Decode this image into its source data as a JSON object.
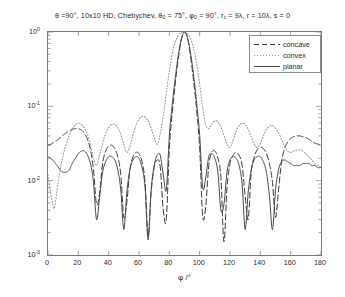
{
  "chart_data": {
    "type": "line",
    "title_parts": {
      "theta": "θ =90°,",
      "array": "10x10 HD,",
      "taper": "Chebychev,",
      "theta0": "θ",
      "theta0_sub": "0",
      "theta0_val": "= 75°,",
      "phi0": "φ",
      "phi0_sub": "0",
      "phi0_val": "= 90°,",
      "rc": "r",
      "rc_sub": "c",
      "rc_val": "= 9λ,",
      "r_val": "r = 10λ,",
      "s_val": "s = 0"
    },
    "xlabel": "φ /°",
    "ylabel": "EΦ(φ)",
    "ylabel_parts": {
      "main": "E",
      "sub": "Φ",
      "arg": "(φ)"
    },
    "xlim": [
      0,
      180
    ],
    "ylim": [
      0.001,
      1
    ],
    "yscale": "log",
    "xticks": [
      0,
      20,
      40,
      60,
      80,
      100,
      120,
      140,
      160,
      180
    ],
    "xtick_labels": [
      "0",
      "20",
      "40",
      "60",
      "80",
      "100",
      "120",
      "140",
      "160",
      "180"
    ],
    "yticks": [
      1,
      0.1,
      0.01,
      0.001
    ],
    "ytick_labels": [
      "10⁰",
      "10⁻¹",
      "10⁻²",
      "10⁻³"
    ],
    "ytick_label_parts": [
      {
        "base": "10",
        "exp": "0"
      },
      {
        "base": "10",
        "exp": "-1"
      },
      {
        "base": "10",
        "exp": "-2"
      },
      {
        "base": "10",
        "exp": "-3"
      }
    ],
    "grid": false,
    "legend_position": "upper right",
    "legend_entries": [
      {
        "label": "concave",
        "style": "dashed",
        "color": "#3a3a3a"
      },
      {
        "label": "convex",
        "style": "dotted",
        "color": "#9a9a9a"
      },
      {
        "label": "planar",
        "style": "solid",
        "color": "#4a4a4a"
      }
    ],
    "main_beam_peak_phi": 90,
    "main_beam_peak_value": 1.0,
    "series": [
      {
        "name": "concave",
        "style": "dashed",
        "color": "#3a3a3a",
        "x": [
          0,
          2,
          4,
          6,
          8,
          10,
          12,
          14,
          16,
          18,
          20,
          22,
          24,
          26,
          28,
          30,
          32,
          34,
          36,
          38,
          40,
          42,
          44,
          46,
          48,
          50,
          52,
          54,
          56,
          58,
          60,
          62,
          64,
          66,
          68,
          70,
          72,
          74,
          76,
          78,
          80,
          82,
          84,
          86,
          88,
          90,
          92,
          94,
          96,
          98,
          100,
          102,
          104,
          106,
          108,
          110,
          112,
          114,
          116,
          118,
          120,
          122,
          124,
          126,
          128,
          130,
          132,
          134,
          136,
          138,
          140,
          142,
          144,
          146,
          148,
          150,
          152,
          154,
          156,
          158,
          160,
          162,
          164,
          166,
          168,
          170,
          172,
          174,
          176,
          178,
          180
        ],
        "y": [
          0.03,
          0.031,
          0.033,
          0.035,
          0.038,
          0.041,
          0.044,
          0.047,
          0.049,
          0.05,
          0.05,
          0.048,
          0.043,
          0.036,
          0.026,
          0.014,
          0.0048,
          0.0068,
          0.017,
          0.025,
          0.029,
          0.03,
          0.027,
          0.021,
          0.012,
          0.0032,
          0.0052,
          0.014,
          0.021,
          0.024,
          0.023,
          0.018,
          0.0095,
          0.0018,
          0.007,
          0.015,
          0.019,
          0.0155,
          0.004,
          0.003,
          0.027,
          0.085,
          0.21,
          0.45,
          0.8,
          1.0,
          0.82,
          0.47,
          0.22,
          0.09,
          0.028,
          0.0033,
          0.0045,
          0.016,
          0.024,
          0.025,
          0.02,
          0.011,
          0.0015,
          0.008,
          0.017,
          0.022,
          0.024,
          0.022,
          0.016,
          0.0062,
          0.003,
          0.013,
          0.021,
          0.026,
          0.028,
          0.027,
          0.023,
          0.017,
          0.0095,
          0.0032,
          0.0075,
          0.018,
          0.027,
          0.033,
          0.037,
          0.039,
          0.04,
          0.04,
          0.039,
          0.038,
          0.036,
          0.034,
          0.032,
          0.031,
          0.03
        ]
      },
      {
        "name": "convex",
        "style": "dotted",
        "color": "#9a9a9a",
        "x": [
          0,
          2,
          4,
          6,
          8,
          10,
          12,
          14,
          16,
          18,
          20,
          22,
          24,
          26,
          28,
          30,
          32,
          34,
          36,
          38,
          40,
          42,
          44,
          46,
          48,
          50,
          52,
          54,
          56,
          58,
          60,
          62,
          64,
          66,
          68,
          70,
          72,
          74,
          76,
          78,
          80,
          82,
          84,
          86,
          88,
          90,
          92,
          94,
          96,
          98,
          100,
          102,
          104,
          106,
          108,
          110,
          112,
          114,
          116,
          118,
          120,
          122,
          124,
          126,
          128,
          130,
          132,
          134,
          136,
          138,
          140,
          142,
          144,
          146,
          148,
          150,
          152,
          154,
          156,
          158,
          160,
          162,
          164,
          166,
          168,
          170,
          172,
          174,
          176,
          178,
          180
        ],
        "y": [
          0.012,
          0.0065,
          0.0042,
          0.0075,
          0.014,
          0.022,
          0.031,
          0.041,
          0.05,
          0.056,
          0.059,
          0.057,
          0.051,
          0.042,
          0.03,
          0.02,
          0.016,
          0.022,
          0.032,
          0.043,
          0.052,
          0.057,
          0.057,
          0.052,
          0.042,
          0.031,
          0.024,
          0.029,
          0.041,
          0.055,
          0.067,
          0.073,
          0.072,
          0.064,
          0.051,
          0.038,
          0.031,
          0.042,
          0.075,
          0.15,
          0.3,
          0.52,
          0.74,
          0.91,
          0.99,
          1.0,
          0.95,
          0.81,
          0.6,
          0.38,
          0.2,
          0.095,
          0.056,
          0.05,
          0.058,
          0.064,
          0.062,
          0.053,
          0.041,
          0.031,
          0.028,
          0.035,
          0.046,
          0.055,
          0.059,
          0.057,
          0.049,
          0.039,
          0.031,
          0.028,
          0.032,
          0.04,
          0.049,
          0.054,
          0.055,
          0.051,
          0.044,
          0.036,
          0.029,
          0.025,
          0.024,
          0.025,
          0.026,
          0.026,
          0.025,
          0.023,
          0.021,
          0.019,
          0.017,
          0.016,
          0.015
        ]
      },
      {
        "name": "planar",
        "style": "solid",
        "color": "#4a4a4a",
        "x": [
          0,
          2,
          4,
          6,
          8,
          10,
          12,
          14,
          16,
          18,
          20,
          22,
          24,
          26,
          28,
          30,
          32,
          34,
          36,
          38,
          40,
          42,
          44,
          46,
          48,
          50,
          52,
          54,
          56,
          58,
          60,
          62,
          64,
          66,
          68,
          70,
          72,
          74,
          76,
          78,
          80,
          82,
          84,
          86,
          88,
          90,
          92,
          94,
          96,
          98,
          100,
          102,
          104,
          106,
          108,
          110,
          112,
          114,
          116,
          118,
          120,
          122,
          124,
          126,
          128,
          130,
          132,
          134,
          136,
          138,
          140,
          142,
          144,
          146,
          148,
          150,
          152,
          154,
          156,
          158,
          160,
          162,
          164,
          166,
          168,
          170,
          172,
          174,
          176,
          178,
          180
        ],
        "y": [
          0.021,
          0.02,
          0.018,
          0.016,
          0.014,
          0.013,
          0.013,
          0.014,
          0.017,
          0.02,
          0.023,
          0.025,
          0.025,
          0.022,
          0.017,
          0.0095,
          0.003,
          0.006,
          0.013,
          0.018,
          0.021,
          0.021,
          0.019,
          0.014,
          0.0075,
          0.0022,
          0.007,
          0.014,
          0.019,
          0.021,
          0.02,
          0.015,
          0.0082,
          0.0016,
          0.0075,
          0.016,
          0.022,
          0.022,
          0.012,
          0.0075,
          0.04,
          0.11,
          0.25,
          0.5,
          0.82,
          1.0,
          0.84,
          0.52,
          0.26,
          0.11,
          0.041,
          0.008,
          0.011,
          0.021,
          0.023,
          0.02,
          0.013,
          0.004,
          0.0048,
          0.013,
          0.019,
          0.021,
          0.02,
          0.016,
          0.009,
          0.0022,
          0.007,
          0.014,
          0.019,
          0.021,
          0.021,
          0.018,
          0.013,
          0.0062,
          0.0022,
          0.0075,
          0.014,
          0.018,
          0.019,
          0.018,
          0.017,
          0.016,
          0.016,
          0.016,
          0.017,
          0.017,
          0.017,
          0.016,
          0.016,
          0.015,
          0.015
        ]
      }
    ]
  },
  "axes": {
    "x_tick_label_0": "0",
    "x_tick_label_1": "20",
    "x_tick_label_2": "40",
    "x_tick_label_3": "60",
    "x_tick_label_4": "80",
    "x_tick_label_5": "100",
    "x_tick_label_6": "120",
    "x_tick_label_7": "140",
    "x_tick_label_8": "160",
    "x_tick_label_9": "180"
  }
}
